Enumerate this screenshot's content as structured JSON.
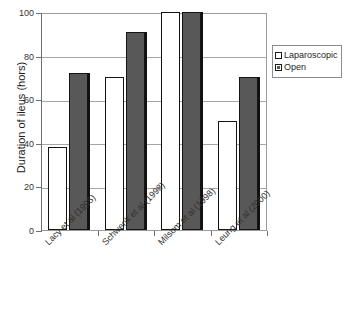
{
  "chart_data": {
    "type": "bar",
    "title": "",
    "xlabel": "",
    "ylabel": "Duration of ileus (hors)",
    "ylim": [
      0,
      100
    ],
    "yticks": [
      0,
      20,
      40,
      60,
      80,
      100
    ],
    "grid": "horizontal",
    "legend_position": "right",
    "categories": [
      "Lacy et al (1995)",
      "Schwenk et al (1998)",
      "Milsom et al (1998)",
      "Leung et al (2000)"
    ],
    "series": [
      {
        "name": "Laparoscopic",
        "color": "#ffffff",
        "values": [
          38,
          70,
          100,
          50
        ]
      },
      {
        "name": "Open",
        "color": "#585858",
        "values": [
          72,
          91,
          100,
          70
        ]
      }
    ]
  },
  "axis": {
    "tick_labels": [
      "100",
      "80",
      "60",
      "40",
      "20",
      "0"
    ]
  },
  "legend": {
    "entries": [
      {
        "label": "Laparoscopic",
        "swatch": "hollow-white-square"
      },
      {
        "label": "Open",
        "swatch": "filled-gray-square"
      }
    ]
  }
}
